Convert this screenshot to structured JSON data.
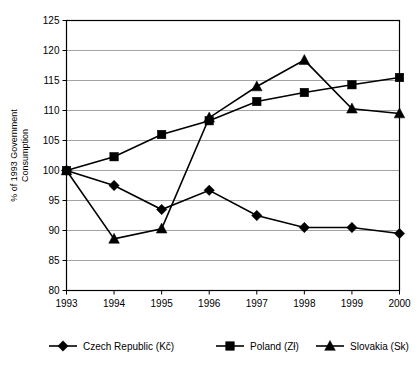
{
  "chart_data": {
    "type": "line",
    "title": "",
    "xlabel": "",
    "ylabel": "% of 1993 Government Consumption",
    "categories": [
      "1993",
      "1994",
      "1995",
      "1996",
      "1997",
      "1998",
      "1999",
      "2000"
    ],
    "x": [
      1993,
      1994,
      1995,
      1996,
      1997,
      1998,
      1999,
      2000
    ],
    "ylim": [
      80,
      125
    ],
    "yticks": [
      80,
      85,
      90,
      95,
      100,
      105,
      110,
      115,
      120,
      125
    ],
    "grid": true,
    "legend_position": "bottom",
    "series": [
      {
        "name": "Czech Republic (Kč)",
        "marker": "diamond",
        "values": [
          100,
          97.5,
          93.5,
          96.7,
          92.5,
          90.5,
          90.5,
          89.5
        ]
      },
      {
        "name": "Poland (Zł)",
        "marker": "square",
        "values": [
          100,
          102.3,
          106.0,
          108.3,
          111.5,
          113.0,
          114.3,
          115.5
        ]
      },
      {
        "name": "Slovakia (Sk)",
        "marker": "triangle",
        "values": [
          100,
          88.6,
          90.3,
          108.8,
          114.0,
          118.4,
          110.3,
          109.5
        ]
      }
    ]
  },
  "axis": {
    "y_label_line1": "% of 1993 Government",
    "y_label_line2": "Consumption",
    "y_tick_labels": [
      "125",
      "120",
      "115",
      "110",
      "105",
      "100",
      "95",
      "90",
      "85",
      "80"
    ],
    "x_tick_labels": [
      "1993",
      "1994",
      "1995",
      "1996",
      "1997",
      "1998",
      "1999",
      "2000"
    ]
  },
  "legend": {
    "items": [
      {
        "label": "Czech Republic (Kč)",
        "marker": "diamond"
      },
      {
        "label": "Poland (Zł)",
        "marker": "square"
      },
      {
        "label": "Slovakia (Sk)",
        "marker": "triangle"
      }
    ]
  },
  "colors": {
    "series": "#000000",
    "gridline": "#8c8c8c",
    "axis": "#000000",
    "background": "#ffffff"
  }
}
